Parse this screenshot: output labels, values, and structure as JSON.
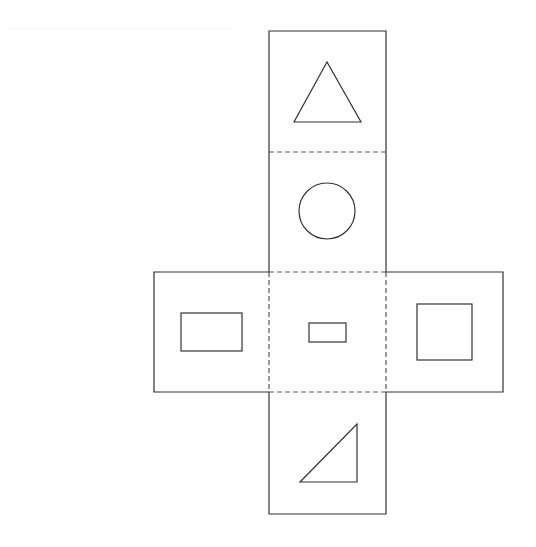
{
  "diagram": {
    "title": "",
    "type": "cube-net",
    "colors": {
      "stroke": "#333333",
      "fold_line": "#555555",
      "background": "#ffffff"
    },
    "faces": [
      {
        "name": "top",
        "shape": "equilateral-triangle"
      },
      {
        "name": "upper-middle",
        "shape": "circle"
      },
      {
        "name": "left",
        "shape": "wide-rectangle"
      },
      {
        "name": "center",
        "shape": "small-rectangle"
      },
      {
        "name": "right",
        "shape": "square"
      },
      {
        "name": "bottom",
        "shape": "right-triangle"
      }
    ],
    "fold_lines": "dashed"
  }
}
